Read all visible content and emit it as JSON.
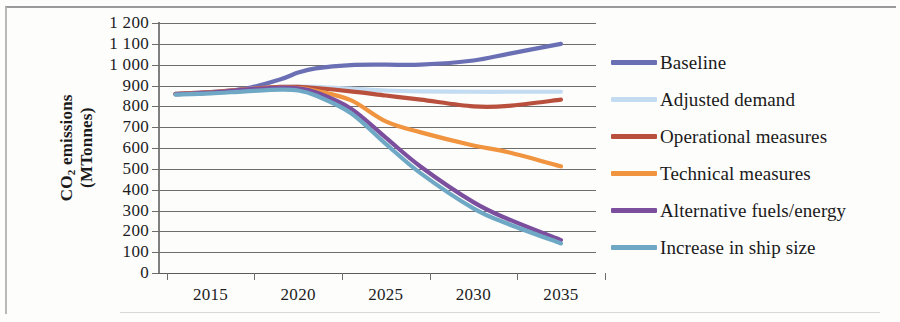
{
  "chart_data": {
    "type": "line",
    "title": "",
    "xlabel": "",
    "ylabel": "CO2 emissions (MTonnes)",
    "ylabel_line1": "CO",
    "ylabel_sub": "2",
    "ylabel_line1_rest": " emissions",
    "ylabel_line2": "(MTonnes)",
    "grid": true,
    "legend_position": "right",
    "xlim": [
      2012,
      2037
    ],
    "ylim": [
      0,
      1200
    ],
    "ytick_step": 100,
    "ytick_labels": [
      "1 200",
      "1 100",
      "1 000",
      "900",
      "800",
      "700",
      "600",
      "500",
      "400",
      "300",
      "200",
      "100",
      "0"
    ],
    "ytick_values": [
      1200,
      1100,
      1000,
      900,
      800,
      700,
      600,
      500,
      400,
      300,
      200,
      100,
      0
    ],
    "xtick_labels": [
      "2015",
      "2020",
      "2025",
      "2030",
      "2035"
    ],
    "xtick_values": [
      2015,
      2020,
      2025,
      2030,
      2035
    ],
    "x": [
      2013,
      2015,
      2017,
      2019,
      2020,
      2021,
      2023,
      2025,
      2027,
      2030,
      2032,
      2035
    ],
    "series": [
      {
        "name": "Baseline",
        "color": "#6b70b4",
        "values": [
          860,
          868,
          885,
          930,
          962,
          982,
          998,
          1000,
          1000,
          1020,
          1052,
          1100
        ]
      },
      {
        "name": "Adjusted demand",
        "color": "#c3dcf1",
        "values": [
          860,
          868,
          882,
          893,
          895,
          893,
          885,
          876,
          872,
          870,
          870,
          870
        ]
      },
      {
        "name": "Operational measures",
        "color": "#b9503d",
        "values": [
          860,
          868,
          882,
          893,
          893,
          888,
          872,
          852,
          832,
          800,
          802,
          832
        ]
      },
      {
        "name": "Technical measures",
        "color": "#f0943f",
        "values": [
          858,
          866,
          880,
          890,
          888,
          875,
          830,
          728,
          675,
          612,
          580,
          512
        ]
      },
      {
        "name": "Alternative fuels/energy",
        "color": "#7b4f9d",
        "values": [
          858,
          866,
          880,
          890,
          886,
          868,
          790,
          650,
          510,
          340,
          258,
          158
        ]
      },
      {
        "name": "Increase in ship size",
        "color": "#6fa8c5",
        "values": [
          856,
          862,
          872,
          880,
          876,
          852,
          768,
          620,
          478,
          310,
          235,
          142
        ]
      }
    ]
  },
  "legend": {
    "items": [
      {
        "label": "Baseline",
        "color": "#6b70b4"
      },
      {
        "label": "Adjusted demand",
        "color": "#c3dcf1"
      },
      {
        "label": "Operational measures",
        "color": "#b9503d"
      },
      {
        "label": "Technical measures",
        "color": "#f0943f"
      },
      {
        "label": "Alternative fuels/energy",
        "color": "#7b4f9d"
      },
      {
        "label": "Increase in ship size",
        "color": "#6fa8c5"
      }
    ]
  }
}
